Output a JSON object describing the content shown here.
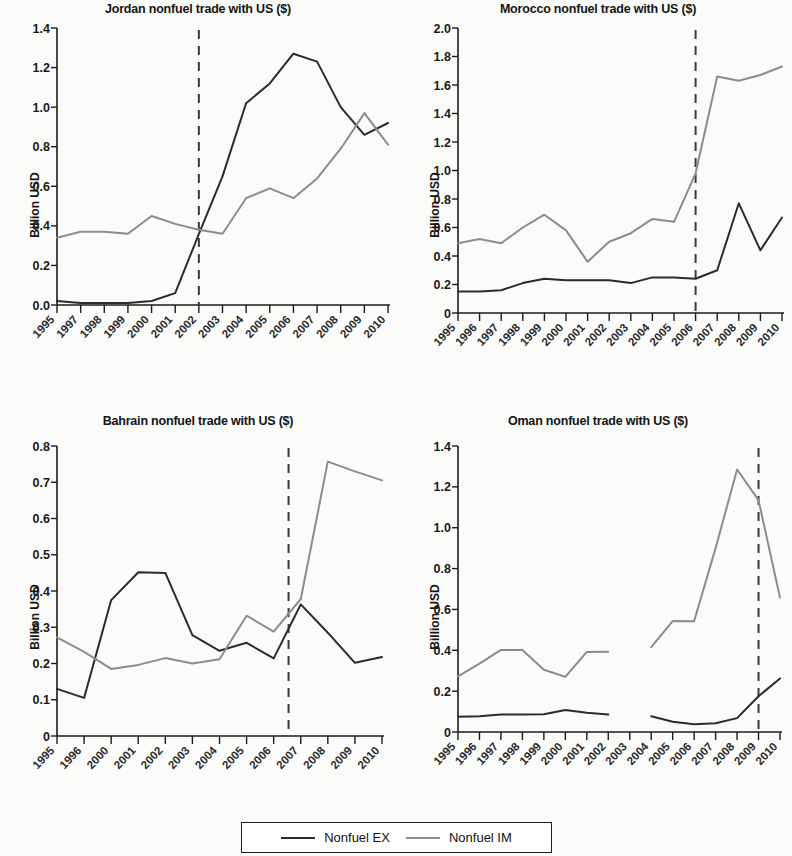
{
  "legend": {
    "items": [
      {
        "label": "Nonfuel EX",
        "key": "ex",
        "color": "#2b2b2b"
      },
      {
        "label": "Nonfuel IM",
        "key": "im",
        "color": "#8f8f8f"
      }
    ]
  },
  "axis_label": "Billion USD",
  "chart_data": [
    {
      "type": "line",
      "title": "Jordan nonfuel trade with US ($)",
      "xlabel": "",
      "ylabel": "Billion USD",
      "ylim": [
        0.0,
        1.4
      ],
      "yticks": [
        0.0,
        0.2,
        0.4,
        0.6,
        0.8,
        1.0,
        1.2,
        1.4
      ],
      "ytick_labels": [
        "0.0",
        "0.2",
        "0.4",
        "0.6",
        "0.8",
        "1.0",
        "1.2",
        "1.4"
      ],
      "categories": [
        "1995",
        "1997",
        "1998",
        "1999",
        "2000",
        "2001",
        "2002",
        "2003",
        "2004",
        "2005",
        "2006",
        "2007",
        "2008",
        "2009",
        "2010"
      ],
      "grid": false,
      "legend_position": "bottom-shared",
      "annotations": [
        {
          "type": "vline",
          "at_category": "2002",
          "style": "dashed"
        }
      ],
      "series": [
        {
          "name": "Nonfuel EX",
          "color": "#2b2b2b",
          "values": [
            0.02,
            0.01,
            0.01,
            0.01,
            0.02,
            0.06,
            0.36,
            0.65,
            1.02,
            1.12,
            1.27,
            1.23,
            1.0,
            0.86,
            0.92
          ]
        },
        {
          "name": "Nonfuel IM",
          "color": "#8f8f8f",
          "values": [
            0.34,
            0.37,
            0.37,
            0.36,
            0.45,
            0.41,
            0.38,
            0.36,
            0.54,
            0.59,
            0.54,
            0.64,
            0.79,
            0.97,
            0.81
          ]
        }
      ]
    },
    {
      "type": "line",
      "title": "Morocco nonfuel trade with US ($)",
      "xlabel": "",
      "ylabel": "Billion USD",
      "ylim": [
        0.0,
        2.0
      ],
      "yticks": [
        0.0,
        0.2,
        0.4,
        0.6,
        0.8,
        1.0,
        1.2,
        1.4,
        1.6,
        1.8,
        2.0
      ],
      "ytick_labels": [
        "0",
        "0.2",
        "0.4",
        "0.6",
        "0.8",
        "1.0",
        "1.2",
        "1.4",
        "1.6",
        "1.8",
        "2.0"
      ],
      "categories": [
        "1995",
        "1996",
        "1997",
        "1998",
        "1999",
        "2000",
        "2001",
        "2002",
        "2003",
        "2004",
        "2005",
        "2006",
        "2007",
        "2008",
        "2009",
        "2010"
      ],
      "grid": false,
      "legend_position": "bottom-shared",
      "annotations": [
        {
          "type": "vline",
          "at_category": "2006",
          "style": "dashed"
        }
      ],
      "series": [
        {
          "name": "Nonfuel EX",
          "color": "#2b2b2b",
          "values": [
            0.15,
            0.15,
            0.16,
            0.21,
            0.24,
            0.23,
            0.23,
            0.23,
            0.21,
            0.25,
            0.25,
            0.24,
            0.3,
            0.77,
            0.44,
            0.67
          ]
        },
        {
          "name": "Nonfuel IM",
          "color": "#8f8f8f",
          "values": [
            0.49,
            0.52,
            0.49,
            0.6,
            0.69,
            0.58,
            0.36,
            0.5,
            0.56,
            0.66,
            0.64,
            0.98,
            1.66,
            1.63,
            1.67,
            1.73
          ]
        }
      ]
    },
    {
      "type": "line",
      "title": "Bahrain nonfuel trade with US ($)",
      "xlabel": "",
      "ylabel": "Billion USD",
      "ylim": [
        0.0,
        0.8
      ],
      "yticks": [
        0.0,
        0.1,
        0.2,
        0.3,
        0.4,
        0.5,
        0.6,
        0.7,
        0.8
      ],
      "ytick_labels": [
        "0",
        "0.1",
        "0.2",
        "0.3",
        "0.4",
        "0.5",
        "0.6",
        "0.7",
        "0.8"
      ],
      "categories": [
        "1995",
        "1996",
        "2000",
        "2001",
        "2002",
        "2003",
        "2004",
        "2005",
        "2006",
        "2007",
        "2008",
        "2009",
        "2010"
      ],
      "grid": false,
      "legend_position": "bottom-shared",
      "annotations": [
        {
          "type": "vline",
          "at_category": "2006",
          "style": "dashed",
          "offset": 0.55
        }
      ],
      "series": [
        {
          "name": "Nonfuel EX",
          "color": "#2b2b2b",
          "values": [
            0.13,
            0.105,
            0.375,
            0.452,
            0.45,
            0.278,
            0.235,
            0.257,
            0.214,
            0.363,
            0.285,
            0.202,
            0.218
          ]
        },
        {
          "name": "Nonfuel IM",
          "color": "#8f8f8f",
          "values": [
            0.272,
            0.232,
            0.185,
            0.196,
            0.215,
            0.2,
            0.212,
            0.332,
            0.288,
            0.378,
            0.757,
            0.73,
            0.705
          ]
        }
      ]
    },
    {
      "type": "line",
      "title": "Oman nonfuel trade with US ($)",
      "xlabel": "",
      "ylabel": "Billion USD",
      "ylim": [
        0.0,
        1.4
      ],
      "yticks": [
        0.0,
        0.2,
        0.4,
        0.6,
        0.8,
        1.0,
        1.2,
        1.4
      ],
      "ytick_labels": [
        "0",
        "0.2",
        "0.4",
        "0.6",
        "0.8",
        "1.0",
        "1.2",
        "1.4"
      ],
      "categories": [
        "1995",
        "1996",
        "1997",
        "1998",
        "1999",
        "2000",
        "2001",
        "2002",
        "2003",
        "2004",
        "2005",
        "2006",
        "2007",
        "2008",
        "2009",
        "2010"
      ],
      "grid": false,
      "legend_position": "bottom-shared",
      "annotations": [
        {
          "type": "vline",
          "at_category": "2009",
          "style": "dashed"
        }
      ],
      "series": [
        {
          "name": "Nonfuel EX",
          "color": "#2b2b2b",
          "values": [
            0.075,
            0.077,
            0.085,
            0.085,
            0.087,
            0.108,
            0.094,
            0.085,
            null,
            0.077,
            0.05,
            0.038,
            0.043,
            0.068,
            0.175,
            0.262
          ]
        },
        {
          "name": "Nonfuel IM",
          "color": "#8f8f8f",
          "values": [
            0.272,
            0.335,
            0.402,
            0.401,
            0.305,
            0.27,
            0.392,
            0.393,
            null,
            0.415,
            0.543,
            0.542,
            0.9,
            1.285,
            1.135,
            0.658
          ]
        }
      ]
    }
  ]
}
